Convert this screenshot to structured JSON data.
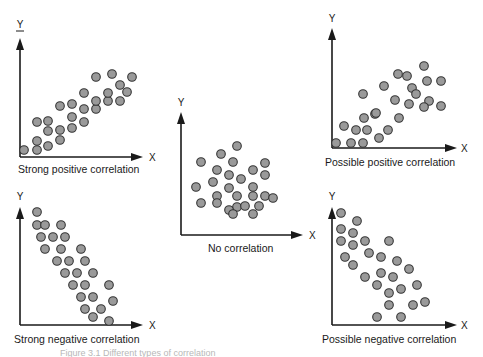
{
  "diagram": {
    "colors": {
      "dot_fill": "#9a9a9a",
      "dot_stroke": "#333333",
      "axis": "#1a1a1a",
      "background": "#ffffff"
    },
    "panels": [
      {
        "id": "strong-positive",
        "caption": "Strong positive correlation",
        "x_label": "X",
        "y_label": "Y",
        "origin": [
          20,
          157
        ],
        "y_top": 38,
        "x_end": 143,
        "y_label_pos": [
          20,
          28
        ],
        "x_label_pos": [
          149,
          161
        ],
        "caption_pos": [
          18,
          173
        ],
        "y_label_underline": true,
        "points": [
          [
            24,
            150
          ],
          [
            37,
            150
          ],
          [
            37,
            141
          ],
          [
            48,
            146
          ],
          [
            48,
            131
          ],
          [
            60,
            140
          ],
          [
            37,
            122
          ],
          [
            48,
            121
          ],
          [
            60,
            130
          ],
          [
            72,
            128
          ],
          [
            60,
            106
          ],
          [
            72,
            117
          ],
          [
            72,
            104
          ],
          [
            84,
            122
          ],
          [
            84,
            109
          ],
          [
            84,
            93
          ],
          [
            96,
            109
          ],
          [
            96,
            101
          ],
          [
            96,
            77
          ],
          [
            108,
            101
          ],
          [
            108,
            93
          ],
          [
            112,
            74
          ],
          [
            120,
            101
          ],
          [
            120,
            85
          ],
          [
            127,
            92
          ],
          [
            132,
            77
          ]
        ]
      },
      {
        "id": "strong-negative",
        "caption": "Strong negative correlation",
        "x_label": "X",
        "y_label": "Y",
        "origin": [
          20,
          325
        ],
        "y_top": 207,
        "x_end": 143,
        "y_label_pos": [
          20,
          200
        ],
        "x_label_pos": [
          149,
          329
        ],
        "caption_pos": [
          14,
          343
        ],
        "y_label_underline": false,
        "points": [
          [
            37,
            212
          ],
          [
            37,
            225
          ],
          [
            45,
            225
          ],
          [
            61,
            225
          ],
          [
            41,
            237
          ],
          [
            53,
            237
          ],
          [
            65,
            237
          ],
          [
            45,
            249
          ],
          [
            61,
            249
          ],
          [
            81,
            249
          ],
          [
            57,
            261
          ],
          [
            69,
            261
          ],
          [
            85,
            261
          ],
          [
            65,
            273
          ],
          [
            77,
            273
          ],
          [
            93,
            273
          ],
          [
            73,
            285
          ],
          [
            85,
            285
          ],
          [
            109,
            285
          ],
          [
            81,
            297
          ],
          [
            93,
            297
          ],
          [
            113,
            301
          ],
          [
            85,
            309
          ],
          [
            101,
            309
          ],
          [
            93,
            317
          ],
          [
            109,
            321
          ]
        ]
      },
      {
        "id": "no-correlation",
        "caption": "No correlation",
        "x_label": "X",
        "y_label": "Y",
        "origin": [
          181,
          235
        ],
        "y_top": 112,
        "x_end": 303,
        "y_label_pos": [
          181,
          106
        ],
        "x_label_pos": [
          309,
          239
        ],
        "caption_pos": [
          208,
          252
        ],
        "y_label_underline": false,
        "points": [
          [
            237,
            146
          ],
          [
            221,
            154
          ],
          [
            201,
            162
          ],
          [
            233,
            162
          ],
          [
            265,
            163
          ],
          [
            217,
            170
          ],
          [
            229,
            175
          ],
          [
            253,
            170
          ],
          [
            265,
            175
          ],
          [
            213,
            182
          ],
          [
            241,
            179
          ],
          [
            253,
            187
          ],
          [
            196,
            187
          ],
          [
            229,
            188
          ],
          [
            217,
            196
          ],
          [
            201,
            203
          ],
          [
            217,
            203
          ],
          [
            237,
            196
          ],
          [
            237,
            207
          ],
          [
            253,
            196
          ],
          [
            265,
            196
          ],
          [
            273,
            198
          ],
          [
            229,
            210
          ],
          [
            245,
            206
          ],
          [
            259,
            206
          ],
          [
            253,
            214
          ],
          [
            233,
            214
          ]
        ]
      },
      {
        "id": "possible-positive",
        "caption": "Possible positive correlation",
        "x_label": "X",
        "y_label": "Y",
        "origin": [
          332,
          148
        ],
        "y_top": 28,
        "x_end": 457,
        "y_label_pos": [
          332,
          22
        ],
        "x_label_pos": [
          461,
          152
        ],
        "caption_pos": [
          325,
          166
        ],
        "y_label_underline": false,
        "points": [
          [
            336,
            143
          ],
          [
            351,
            143
          ],
          [
            363,
            143
          ],
          [
            379,
            138
          ],
          [
            344,
            126
          ],
          [
            356,
            130
          ],
          [
            367,
            130
          ],
          [
            388,
            130
          ],
          [
            364,
            118
          ],
          [
            375,
            114
          ],
          [
            363,
            94
          ],
          [
            376,
            113
          ],
          [
            384,
            86
          ],
          [
            395,
            100
          ],
          [
            399,
            118
          ],
          [
            398,
            74
          ],
          [
            409,
            104
          ],
          [
            407,
            76
          ],
          [
            412,
            88
          ],
          [
            416,
            94
          ],
          [
            424,
            66
          ],
          [
            427,
            81
          ],
          [
            429,
            101
          ],
          [
            441,
            81
          ],
          [
            441,
            106
          ],
          [
            424,
            107
          ]
        ]
      },
      {
        "id": "possible-negative",
        "caption": "Possible negative correlation",
        "x_label": "X",
        "y_label": "Y",
        "origin": [
          332,
          325
        ],
        "y_top": 207,
        "x_end": 457,
        "y_label_pos": [
          332,
          200
        ],
        "x_label_pos": [
          461,
          329
        ],
        "caption_pos": [
          322,
          343
        ],
        "y_label_underline": false,
        "points": [
          [
            341,
            213
          ],
          [
            357,
            221
          ],
          [
            341,
            229
          ],
          [
            353,
            233
          ],
          [
            341,
            241
          ],
          [
            353,
            245
          ],
          [
            365,
            241
          ],
          [
            389,
            241
          ],
          [
            345,
            257
          ],
          [
            369,
            253
          ],
          [
            381,
            257
          ],
          [
            353,
            265
          ],
          [
            397,
            261
          ],
          [
            409,
            269
          ],
          [
            365,
            277
          ],
          [
            381,
            273
          ],
          [
            393,
            277
          ],
          [
            377,
            285
          ],
          [
            401,
            289
          ],
          [
            417,
            285
          ],
          [
            389,
            293
          ],
          [
            389,
            305
          ],
          [
            413,
            305
          ],
          [
            425,
            302
          ],
          [
            377,
            317
          ],
          [
            401,
            317
          ]
        ]
      }
    ],
    "footer_caption_partial": "Figure 3.1   Different types of correlation"
  }
}
